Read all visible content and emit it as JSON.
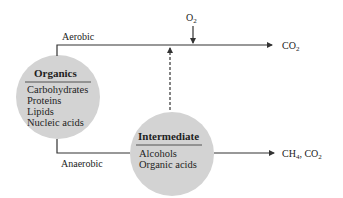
{
  "diagram": {
    "top_path": {
      "label": "Aerobic",
      "input_label": "O",
      "input_sub": "2",
      "output_label": "CO",
      "output_sub": "2"
    },
    "bottom_path": {
      "label": "Anaerobic",
      "output_label_a": "CH",
      "output_sub_a": "4",
      "output_label_b": ", CO",
      "output_sub_b": "2"
    },
    "organics": {
      "title": "Organics",
      "items": [
        "Carbohydrates",
        "Proteins",
        "Lipids",
        "Nucleic acids"
      ]
    },
    "intermediate": {
      "title": "Intermediate",
      "items": [
        "Alcohols",
        "Organic acids"
      ]
    },
    "colors": {
      "circle_fill": "#d3d3d3",
      "line": "#333333",
      "background": "#ffffff"
    }
  }
}
